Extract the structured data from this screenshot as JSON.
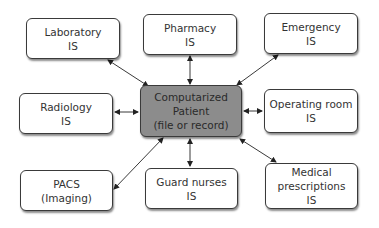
{
  "diagram": {
    "center": {
      "lines": [
        "Computarized",
        "Patient",
        "(file or record)"
      ],
      "fill": "#8c8c8c"
    },
    "nodes": [
      {
        "id": "laboratory",
        "lines": [
          "Laboratory",
          "IS"
        ]
      },
      {
        "id": "pharmacy",
        "lines": [
          "Pharmacy",
          "IS"
        ]
      },
      {
        "id": "emergency",
        "lines": [
          "Emergency",
          "IS"
        ]
      },
      {
        "id": "radiology",
        "lines": [
          "Radiology",
          "IS"
        ]
      },
      {
        "id": "operating-room",
        "lines": [
          "Operating room",
          "IS"
        ]
      },
      {
        "id": "pacs",
        "lines": [
          "PACS",
          "(Imaging)"
        ]
      },
      {
        "id": "guard-nurses",
        "lines": [
          "Guard nurses",
          "IS"
        ]
      },
      {
        "id": "medical-prescriptions",
        "lines": [
          "Medical",
          "prescriptions",
          "IS"
        ]
      }
    ],
    "edges": [
      {
        "from": "center",
        "to": "laboratory",
        "bidirectional": true
      },
      {
        "from": "center",
        "to": "pharmacy",
        "bidirectional": true
      },
      {
        "from": "center",
        "to": "emergency",
        "bidirectional": true
      },
      {
        "from": "center",
        "to": "radiology",
        "bidirectional": true
      },
      {
        "from": "center",
        "to": "operating-room",
        "bidirectional": true
      },
      {
        "from": "center",
        "to": "pacs",
        "bidirectional": true
      },
      {
        "from": "center",
        "to": "guard-nurses",
        "bidirectional": true
      },
      {
        "from": "center",
        "to": "medical-prescriptions",
        "bidirectional": true
      }
    ]
  }
}
